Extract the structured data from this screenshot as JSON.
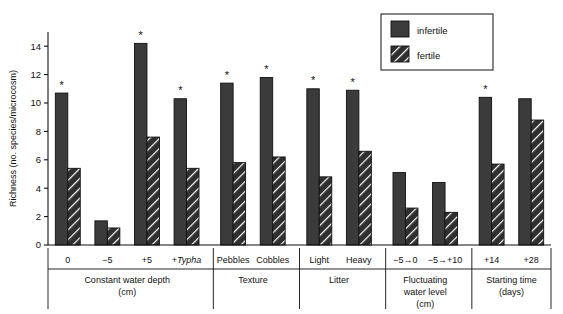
{
  "chart_data": {
    "type": "bar",
    "title": "",
    "xlabel": "",
    "ylabel": "Richness (no. species/microcosm)",
    "ylim": [
      0,
      15
    ],
    "yticks": [
      0,
      2,
      4,
      6,
      8,
      10,
      12,
      14
    ],
    "grid": false,
    "legend_position": "top-right",
    "legend": [
      "infertile",
      "fertile"
    ],
    "series": [
      {
        "name": "infertile",
        "values": [
          10.7,
          1.7,
          14.2,
          10.3,
          11.4,
          11.8,
          11.0,
          10.9,
          5.1,
          4.4,
          10.4,
          10.3
        ]
      },
      {
        "name": "fertile",
        "values": [
          5.4,
          1.2,
          7.6,
          5.4,
          5.8,
          6.2,
          4.8,
          6.6,
          2.6,
          2.3,
          5.7,
          8.8
        ]
      }
    ],
    "categories": [
      "0",
      "−5",
      "+5",
      "+Typha",
      "Pebbles",
      "Cobbles",
      "Light",
      "Heavy",
      "−5→0",
      "−5→+10",
      "+14",
      "+28"
    ],
    "category_italic": [
      false,
      false,
      false,
      true,
      false,
      false,
      false,
      false,
      false,
      false,
      false,
      false
    ],
    "significance_markers": {
      "symbol": "*",
      "on_series": "infertile",
      "categories": [
        "0",
        "+5",
        "+Typha",
        "Pebbles",
        "Cobbles",
        "Light",
        "Heavy",
        "+14"
      ]
    },
    "groups": [
      {
        "label": "Constant water depth",
        "sublabel": "(cm)",
        "categories": [
          "0",
          "−5",
          "+5",
          "+Typha"
        ]
      },
      {
        "label": "Texture",
        "sublabel": "",
        "categories": [
          "Pebbles",
          "Cobbles"
        ]
      },
      {
        "label": "Litter",
        "sublabel": "",
        "categories": [
          "Light",
          "Heavy"
        ]
      },
      {
        "label": "Fluctuating",
        "sublabel": "water level",
        "sublabel2": "(cm)",
        "categories": [
          "−5→0",
          "−5→+10"
        ]
      },
      {
        "label": "Starting time",
        "sublabel": "(days)",
        "categories": [
          "+14",
          "+28"
        ]
      }
    ],
    "colors": {
      "bar_infertile": "#3b3b3b",
      "bar_fertile_fill": "#2f2f2f",
      "bar_edge": "#111111",
      "axis": "#111111",
      "background": "#ffffff"
    }
  }
}
